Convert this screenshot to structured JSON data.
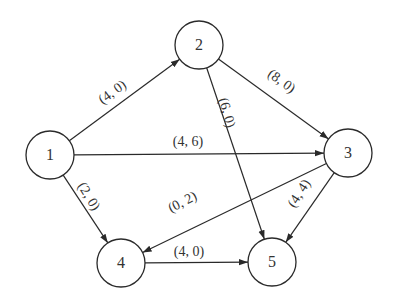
{
  "diagram": {
    "type": "directed-network-flow-graph",
    "nodes": [
      {
        "id": "1",
        "label": "1",
        "x": 50,
        "y": 155
      },
      {
        "id": "2",
        "label": "2",
        "x": 199,
        "y": 45
      },
      {
        "id": "3",
        "label": "3",
        "x": 348,
        "y": 153
      },
      {
        "id": "4",
        "label": "4",
        "x": 121,
        "y": 263
      },
      {
        "id": "5",
        "label": "5",
        "x": 272,
        "y": 262
      }
    ],
    "node_radius": 24,
    "edges": [
      {
        "from": "1",
        "to": "2",
        "label": "(4, 0)",
        "lx": 113,
        "ly": 93,
        "rot": -36
      },
      {
        "from": "1",
        "to": "3",
        "label": "(4, 6)",
        "lx": 188,
        "ly": 143,
        "rot": 0
      },
      {
        "from": "1",
        "to": "4",
        "label": "(2, 0)",
        "lx": 88,
        "ly": 197,
        "rot": 58
      },
      {
        "from": "2",
        "to": "3",
        "label": "(8, 0)",
        "lx": 281,
        "ly": 82,
        "rot": 36
      },
      {
        "from": "2",
        "to": "5",
        "label": "(6, 0)",
        "lx": 226,
        "ly": 113,
        "rot": 74
      },
      {
        "from": "3",
        "to": "4",
        "label": "(0, 2)",
        "lx": 183,
        "ly": 203,
        "rot": -27
      },
      {
        "from": "3",
        "to": "5",
        "label": "(4, 4)",
        "lx": 300,
        "ly": 194,
        "rot": -57
      },
      {
        "from": "4",
        "to": "5",
        "label": "(4, 0)",
        "lx": 189,
        "ly": 253,
        "rot": 0
      }
    ]
  }
}
